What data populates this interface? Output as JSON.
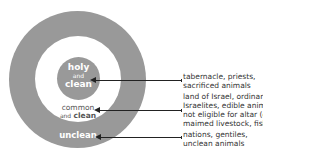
{
  "diagram": {
    "type": "concentric-circles",
    "colors": {
      "ring": "#999999",
      "background": "#ffffff",
      "text_inside": "#ffffff",
      "text_outside": "#333333",
      "arrow": "#222222"
    },
    "zones": [
      {
        "id": "inner",
        "label_line1": "holy",
        "label_line2": "and",
        "label_line3": "clean",
        "description": [
          "tabernacle, priests,",
          "sacrificed animals"
        ]
      },
      {
        "id": "middle",
        "label_line1": "common",
        "label_line2a": "and",
        "label_line2b": "clean",
        "description": [
          "land of Israel, ordinary",
          "Israelites, edible animals",
          "not eligible for altar (deer,",
          "maimed livestock, fish)"
        ]
      },
      {
        "id": "outer",
        "label_line1": "unclean",
        "description": [
          "nations, gentiles,",
          "unclean animals"
        ]
      }
    ]
  }
}
